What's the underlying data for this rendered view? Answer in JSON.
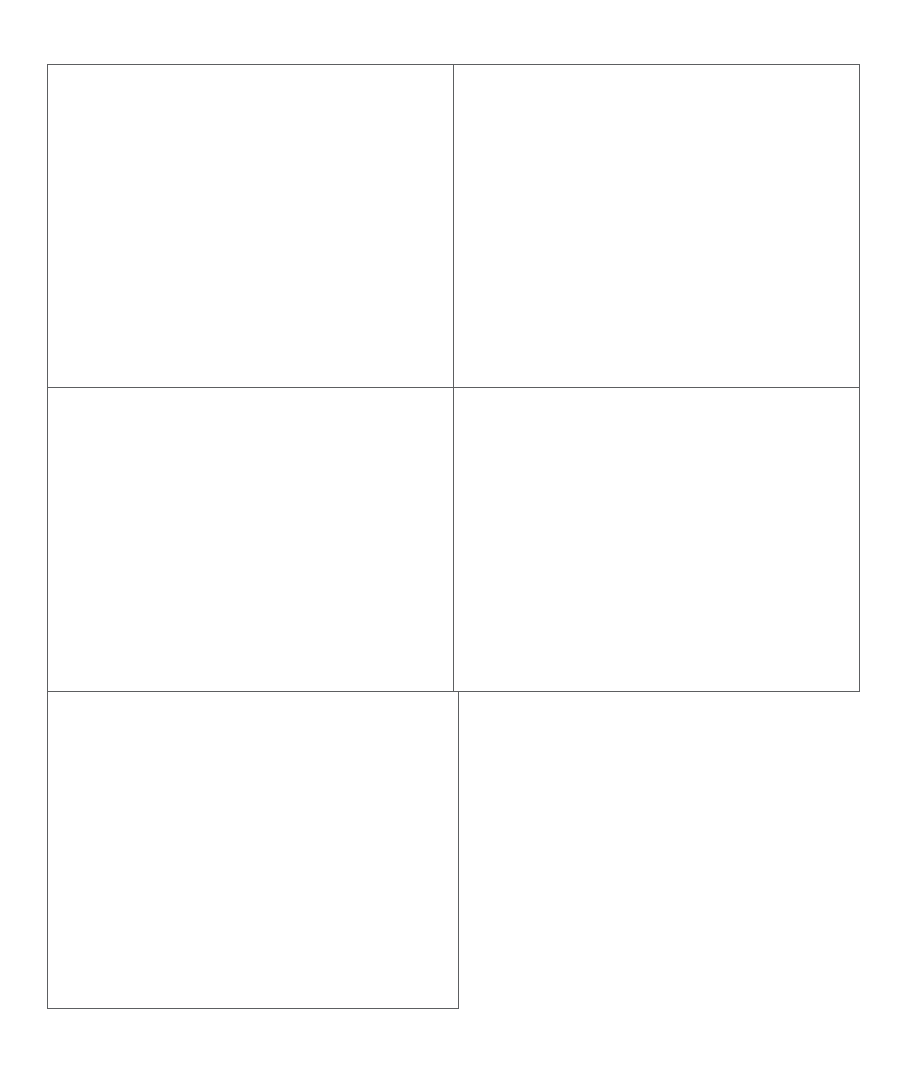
{
  "figure": {
    "background_color": "#ffffff",
    "panel_border_color": "#5d5f61",
    "colors": {
      "bar_dark": "#141414",
      "bar_gray": "#8d8d8d",
      "pyramid_white": "#f2f2f0",
      "floor_gray": "#a8a8a8",
      "axis": "#4a4c4e"
    }
  },
  "panels": [
    {
      "letter": "A",
      "ylabel": "SCE",
      "categories": [
        "Control",
        "CHO–K1",
        "HL"
      ],
      "yticks": [
        0,
        1,
        2,
        3
      ],
      "ylim": [
        0,
        3
      ]
    },
    {
      "letter": "B",
      "ylabel": "SCGE",
      "categories": [
        "Control",
        "CHO–K0"
      ],
      "yticks": [
        0,
        2,
        4,
        6,
        8,
        10,
        12
      ],
      "ylim": [
        0,
        12
      ]
    },
    {
      "letter": "C",
      "ylabel": "MN",
      "categories": [
        "Control",
        "CHO–K1"
      ],
      "yticks": [
        0,
        1,
        2,
        3,
        4,
        5,
        6
      ],
      "ylim": [
        0,
        6
      ]
    },
    {
      "letter": "D",
      "ylabel": "M",
      "categories": [
        "Control",
        "HL"
      ],
      "yticks": [
        0,
        1,
        2,
        3
      ],
      "ylim": [
        0,
        3
      ]
    },
    {
      "letter": "E",
      "ylabel": "PRI",
      "categories": [
        "Control",
        "CHO–K1",
        "HL"
      ],
      "yticks": [
        0,
        1,
        2,
        3
      ],
      "ylim": [
        0,
        3
      ]
    }
  ],
  "chart_data": [
    {
      "type": "bar",
      "title": "A",
      "ylabel": "SCE",
      "xlabel": "",
      "categories": [
        "Control",
        "CHO–K1",
        "HL"
      ],
      "ylim": [
        0,
        3
      ],
      "yticks": [
        0,
        1,
        2,
        3
      ],
      "grid": false,
      "legend": "none",
      "projection": "3d",
      "series": [
        {
          "name": "control-pyramid",
          "shape": "pyramid",
          "color": "#f2f2f0",
          "values": [
            1.15,
            null,
            null
          ]
        },
        {
          "name": "dark-cylinder",
          "shape": "cylinder",
          "color": "#141414",
          "values": [
            null,
            1.6,
            1.6
          ]
        },
        {
          "name": "gray-cylinder",
          "shape": "cylinder",
          "color": "#8d8d8d",
          "values": [
            null,
            1.8,
            1.8
          ]
        }
      ]
    },
    {
      "type": "bar",
      "title": "B",
      "ylabel": "SCGE",
      "xlabel": "",
      "categories": [
        "Control",
        "CHO–K0"
      ],
      "ylim": [
        0,
        12
      ],
      "yticks": [
        0,
        2,
        4,
        6,
        8,
        10,
        12
      ],
      "grid": false,
      "legend": "none",
      "projection": "3d",
      "series": [
        {
          "name": "control-pyramid",
          "shape": "pyramid",
          "color": "#f2f2f0",
          "values": [
            1.2,
            null
          ]
        },
        {
          "name": "dark-cylinder",
          "shape": "cylinder",
          "color": "#141414",
          "values": [
            null,
            10.3
          ]
        },
        {
          "name": "gray-cylinder",
          "shape": "cylinder",
          "color": "#8d8d8d",
          "values": [
            null,
            11.4
          ]
        }
      ]
    },
    {
      "type": "bar",
      "title": "C",
      "ylabel": "MN",
      "xlabel": "",
      "categories": [
        "Control",
        "CHO–K1"
      ],
      "ylim": [
        0,
        6
      ],
      "yticks": [
        0,
        1,
        2,
        3,
        4,
        5,
        6
      ],
      "grid": false,
      "legend": "none",
      "projection": "3d",
      "series": [
        {
          "name": "control-pyramid",
          "shape": "pyramid",
          "color": "#f2f2f0",
          "values": [
            1.45,
            null
          ]
        },
        {
          "name": "dark-cylinder",
          "shape": "cylinder",
          "color": "#141414",
          "values": [
            null,
            5.0
          ]
        },
        {
          "name": "gray-cylinder",
          "shape": "cylinder",
          "color": "#8d8d8d",
          "values": [
            null,
            3.4
          ]
        }
      ]
    },
    {
      "type": "bar",
      "title": "D",
      "ylabel": "M",
      "xlabel": "",
      "categories": [
        "Control",
        "HL"
      ],
      "ylim": [
        0,
        3
      ],
      "yticks": [
        0,
        1,
        2,
        3
      ],
      "grid": false,
      "legend": "none",
      "projection": "3d",
      "series": [
        {
          "name": "control-pyramid",
          "shape": "pyramid",
          "color": "#f2f2f0",
          "values": [
            1.3,
            null
          ]
        },
        {
          "name": "dark-cylinder",
          "shape": "cylinder",
          "color": "#141414",
          "values": [
            null,
            0.2
          ]
        },
        {
          "name": "gray-cylinder",
          "shape": "cylinder",
          "color": "#8d8d8d",
          "values": [
            null,
            0.04
          ]
        }
      ]
    },
    {
      "type": "bar",
      "title": "E",
      "ylabel": "PRI",
      "xlabel": "",
      "categories": [
        "Control",
        "CHO–K1",
        "HL"
      ],
      "ylim": [
        0,
        3
      ],
      "yticks": [
        0,
        1,
        2,
        3
      ],
      "grid": false,
      "legend": "none",
      "projection": "3d",
      "series": [
        {
          "name": "control-pyramid",
          "shape": "pyramid",
          "color": "#f2f2f0",
          "values": [
            1.15,
            null,
            null
          ]
        },
        {
          "name": "dark-cylinder",
          "shape": "cylinder",
          "color": "#141414",
          "values": [
            null,
            0.95,
            0.98
          ]
        },
        {
          "name": "gray-cylinder",
          "shape": "cylinder",
          "color": "#8d8d8d",
          "values": [
            null,
            1.13,
            0.67
          ]
        }
      ]
    }
  ]
}
